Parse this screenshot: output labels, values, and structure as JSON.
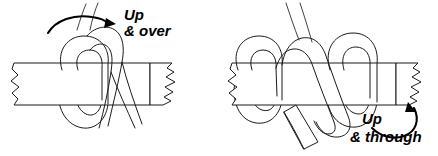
{
  "figure": {
    "background_color": "#ffffff",
    "line_color": "#1a1a1a",
    "text_color": "#000000",
    "width": 438,
    "height": 156
  },
  "panels": [
    {
      "id": "panel-left",
      "step": "1",
      "caption_line1": "Up",
      "caption_line2": "& over",
      "caption_x": 124,
      "caption_y": 20,
      "arrow": {
        "name": "up-and-over-arrow",
        "direction": "curves from lower-left up and over to the right",
        "head_x": 112,
        "head_y": 23
      },
      "strap": {
        "name": "horizontal-strap",
        "left_edge": "torn",
        "right_edge": "torn",
        "top_y": 62,
        "bottom_y": 105
      },
      "elements": [
        "vertical-band-loop",
        "band-tail-right",
        "band-tail-lower"
      ]
    },
    {
      "id": "panel-right",
      "step": "2",
      "caption_line1": "Up",
      "caption_line2": "& through",
      "caption_x": 362,
      "caption_y": 124,
      "arrow": {
        "name": "up-and-through-arrow",
        "direction": "curves from lower-right upward pointing up-left",
        "head_x": 411,
        "head_y": 106
      },
      "strap": {
        "name": "horizontal-strap",
        "left_edge": "torn",
        "right_edge": "torn",
        "top_y": 62,
        "bottom_y": 105
      },
      "elements": [
        "left-loop",
        "right-loop",
        "crossing-band",
        "band-free-end",
        "band-tails-top"
      ]
    }
  ]
}
